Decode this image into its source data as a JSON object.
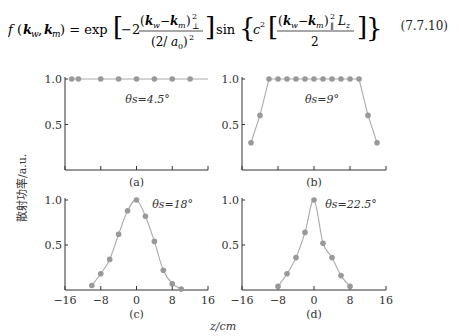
{
  "equation": {
    "lhs": "f (k_w, k_m) =",
    "rhs_exp": "exp",
    "rhs_sin": "sin",
    "number": "(7.7.10)",
    "display": "f(k_w,k_m) = exp[−2 (k_w−k_m)²_⊥ / (2/a₀)²] sin{ c² [ (k_w−k_m)²_∥ L_z / 2 ] }"
  },
  "figure": {
    "ylabel": "散射功率/a.u.",
    "xlabel": "z/cm",
    "panels": [
      {
        "label": "(a)",
        "annotation": "θs=4.5°"
      },
      {
        "label": "(b)",
        "annotation": "θs=9°"
      },
      {
        "label": "(c)",
        "annotation": "θs=18°"
      },
      {
        "label": "(d)",
        "annotation": "θs=22.5°"
      }
    ],
    "yticks": [
      "1.0",
      "0.5"
    ],
    "xticks": [
      "−16",
      "−8",
      "0",
      "8",
      "16"
    ]
  },
  "chart_data": [
    {
      "type": "line",
      "title": "θs=4.5°",
      "label": "(a)",
      "xlabel": "z/cm",
      "ylabel": "散射功率/a.u.",
      "xlim": [
        -16,
        16
      ],
      "ylim": [
        0,
        1.0
      ],
      "x": [
        -14,
        -12.5,
        -10,
        -6,
        -2,
        2,
        6,
        10,
        12.5
      ],
      "values": [
        1.0,
        1.0,
        1.0,
        1.0,
        1.0,
        1.0,
        1.0,
        1.0,
        1.0
      ],
      "series": [
        {
          "name": "measured",
          "x": [
            -14.5,
            -13,
            -8,
            -4,
            0,
            4,
            8,
            12
          ],
          "values": [
            1,
            1,
            1,
            1,
            1,
            1,
            1,
            1
          ]
        }
      ]
    },
    {
      "type": "line",
      "title": "θs=9°",
      "label": "(b)",
      "xlabel": "z/cm",
      "ylabel": "散射功率/a.u.",
      "xlim": [
        -16,
        16
      ],
      "ylim": [
        0,
        1.0
      ],
      "series": [
        {
          "name": "measured",
          "x": [
            -14,
            -12,
            -10,
            -8,
            -6,
            -4,
            -2,
            0,
            2,
            4,
            6,
            8,
            10,
            12,
            14
          ],
          "values": [
            0.3,
            0.6,
            1.0,
            1.0,
            1.0,
            1.0,
            1.0,
            1.0,
            1.0,
            1.0,
            1.0,
            1.0,
            1.0,
            0.6,
            0.3
          ]
        }
      ]
    },
    {
      "type": "line",
      "title": "θs=18°",
      "label": "(c)",
      "xlabel": "z/cm",
      "ylabel": "散射功率/a.u.",
      "xlim": [
        -16,
        16
      ],
      "ylim": [
        0,
        1.0
      ],
      "series": [
        {
          "name": "measured",
          "x": [
            -10,
            -8,
            -6,
            -4,
            -2,
            0,
            2,
            4,
            6,
            8,
            10
          ],
          "values": [
            0.05,
            0.18,
            0.34,
            0.62,
            0.88,
            1.0,
            0.82,
            0.54,
            0.22,
            0.07,
            0.01
          ]
        }
      ]
    },
    {
      "type": "line",
      "title": "θs=22.5°",
      "label": "(d)",
      "xlabel": "z/cm",
      "ylabel": "散射功率/a.u.",
      "xlim": [
        -16,
        16
      ],
      "ylim": [
        0,
        1.0
      ],
      "series": [
        {
          "name": "measured",
          "x": [
            -8,
            -6,
            -4,
            -2,
            0,
            2,
            4,
            6,
            8
          ],
          "values": [
            0.04,
            0.18,
            0.36,
            0.64,
            1.0,
            0.52,
            0.36,
            0.16,
            0.04
          ]
        }
      ]
    }
  ]
}
